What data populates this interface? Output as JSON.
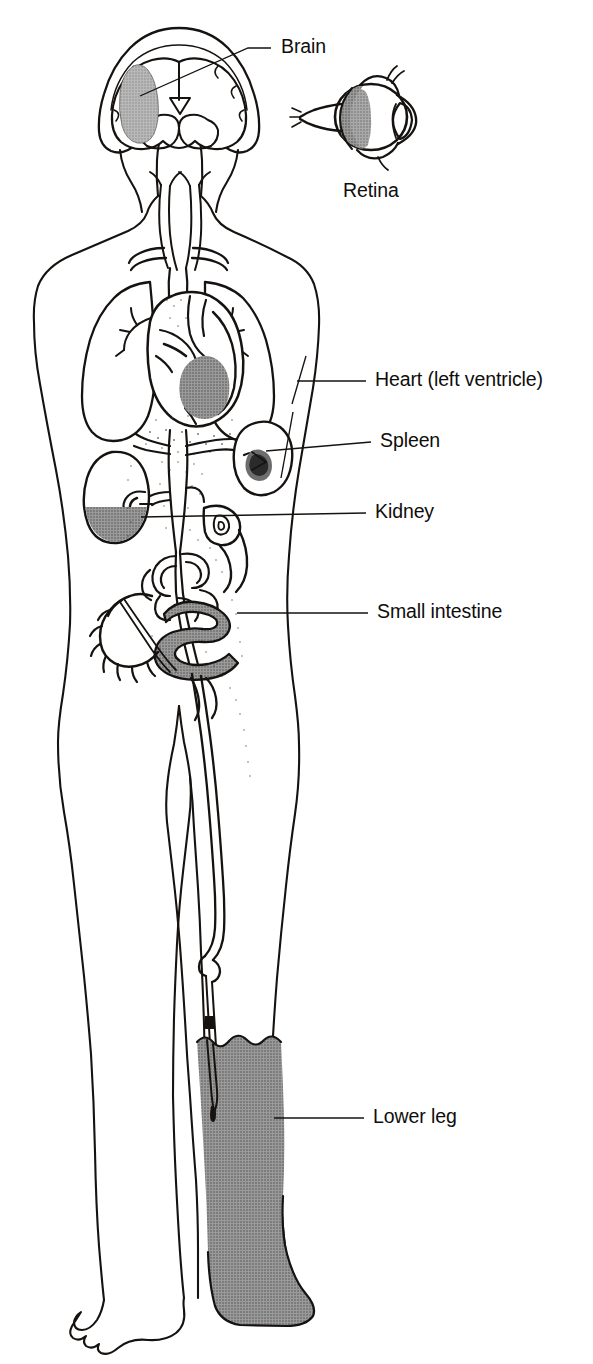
{
  "figure": {
    "type": "anatomical-diagram",
    "view": "full-body anterior outline with organ cutaways",
    "background_color": "#ffffff",
    "line_color": "#16120f",
    "shading": {
      "infarct_gray": "#8d8d8d",
      "infarct_gray_light": "#ababab",
      "infarct_gray_dark": "#6d6d6d",
      "stipple_color": "#3a3a3a"
    }
  },
  "labels": [
    {
      "id": "brain",
      "text": "Brain",
      "text_x": 281,
      "text_y": 48,
      "anchor": "start",
      "leader": [
        [
          271,
          48
        ],
        [
          248,
          48
        ],
        [
          140,
          96
        ]
      ],
      "target_organ": "brain",
      "region": "head"
    },
    {
      "id": "retina",
      "text": "Retina",
      "text_x": 343,
      "text_y": 192,
      "anchor": "start",
      "leader": [],
      "target_organ": "eye",
      "region": "head"
    },
    {
      "id": "heart",
      "text": "Heart (left ventricle)",
      "text_x": 375,
      "text_y": 381,
      "anchor": "start",
      "leader": [
        [
          366,
          381
        ],
        [
          297,
          381
        ]
      ],
      "target_organ": "heart",
      "region": "thorax"
    },
    {
      "id": "spleen",
      "text": "Spleen",
      "text_x": 380,
      "text_y": 442,
      "anchor": "start",
      "leader": [
        [
          371,
          442
        ],
        [
          266,
          452
        ]
      ],
      "target_organ": "spleen",
      "region": "abdomen"
    },
    {
      "id": "kidney",
      "text": "Kidney",
      "text_x": 375,
      "text_y": 513,
      "anchor": "start",
      "leader": [
        [
          366,
          513
        ],
        [
          141,
          517
        ]
      ],
      "target_organ": "kidney",
      "region": "abdomen"
    },
    {
      "id": "small-intestine",
      "text": "Small intestine",
      "text_x": 377,
      "text_y": 613,
      "anchor": "start",
      "leader": [
        [
          368,
          613
        ],
        [
          237,
          613
        ]
      ],
      "target_organ": "small-intestine",
      "region": "abdomen"
    },
    {
      "id": "lower-leg",
      "text": "Lower leg",
      "text_x": 373,
      "text_y": 1118,
      "anchor": "start",
      "leader": [
        [
          364,
          1118
        ],
        [
          274,
          1118
        ]
      ],
      "target_organ": "lower-leg",
      "region": "leg"
    }
  ],
  "infarct_regions": [
    {
      "id": "brain-infarct",
      "organ": "Brain",
      "shade": "#a9a9a9",
      "note": "wedge in left cerebral hemisphere"
    },
    {
      "id": "retina-infarct",
      "organ": "Retina",
      "shade": "#8d8d8d",
      "note": "crescent along posterior globe"
    },
    {
      "id": "heart-infarct",
      "organ": "Heart (left ventricle)",
      "shade": "#8d8d8d",
      "note": "left ventricular free wall"
    },
    {
      "id": "spleen-infarct",
      "organ": "Spleen",
      "shade": "#6d6d6d",
      "note": "hilar wedge"
    },
    {
      "id": "kidney-infarct",
      "organ": "Kidney",
      "shade": "#8d8d8d",
      "note": "lower pole wedge"
    },
    {
      "id": "intestine-infarct",
      "organ": "Small intestine",
      "shade": "#8d8d8d",
      "note": "mid jejunal loop"
    },
    {
      "id": "leg-infarct",
      "organ": "Lower leg",
      "shade": "#8d8d8d",
      "note": "entire lower leg and foot"
    }
  ],
  "organ_list": [
    "Brain",
    "Retina",
    "Heart (left ventricle)",
    "Spleen",
    "Kidney",
    "Small intestine",
    "Lower leg"
  ]
}
